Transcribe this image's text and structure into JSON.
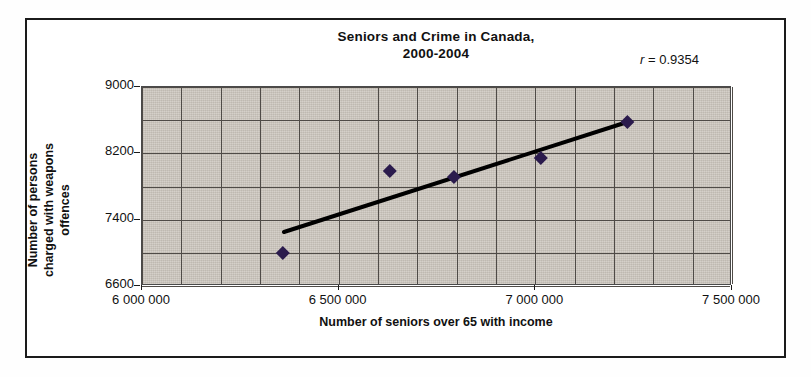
{
  "chart_data": {
    "type": "scatter",
    "title": "Seniors and Crime in Canada, 2000-2004",
    "title_lines": [
      "Seniors and Crime in Canada,",
      "2000-2004"
    ],
    "xlabel": "Number of seniors over 65 with income",
    "ylabel_lines": [
      "Number of persons",
      "charged with weapons",
      "offences"
    ],
    "ylabel": "Number of persons charged with weapons offences",
    "annotation": {
      "symbol": "r",
      "equals": " = ",
      "value": "0.9354",
      "full": "r = 0.9354"
    },
    "xlim": [
      6000000,
      7500000
    ],
    "ylim": [
      6600,
      9000
    ],
    "xticks": [
      6000000,
      6500000,
      7000000,
      7500000
    ],
    "xtick_labels": [
      "6 000 000",
      "6 500 000",
      "7 000 000",
      "7 500 000"
    ],
    "yticks": [
      6600,
      7400,
      8200,
      9000
    ],
    "ytick_labels": [
      "6600",
      "7400",
      "8200",
      "9000"
    ],
    "x_minor_step": 100000,
    "y_minor_step": 400,
    "grid": true,
    "legend": "none",
    "plot_background": "#c9c3ba",
    "marker_color": "#2b1b4d",
    "marker_shape": "diamond",
    "trendline_color": "#000000",
    "points": [
      {
        "x": 6358000,
        "y": 6998
      },
      {
        "x": 6630000,
        "y": 7988
      },
      {
        "x": 6793000,
        "y": 7915
      },
      {
        "x": 7014000,
        "y": 8144
      },
      {
        "x": 7234000,
        "y": 8578
      }
    ],
    "trendline": {
      "x0": 6361000,
      "y0": 7251,
      "x1": 7234000,
      "y1": 8578
    }
  }
}
